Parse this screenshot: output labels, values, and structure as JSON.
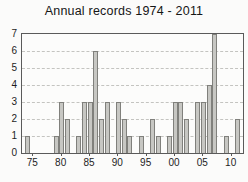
{
  "title": "Annual records 1974 - 2011",
  "chart_data": {
    "type": "bar",
    "title": "Annual records 1974 - 2011",
    "xlabel": "",
    "ylabel": "",
    "categories": [
      1974,
      1975,
      1976,
      1977,
      1978,
      1979,
      1980,
      1981,
      1982,
      1983,
      1984,
      1985,
      1986,
      1987,
      1988,
      1989,
      1990,
      1991,
      1992,
      1993,
      1994,
      1995,
      1996,
      1997,
      1998,
      1999,
      2000,
      2001,
      2002,
      2003,
      2004,
      2005,
      2006,
      2007,
      2008,
      2009,
      2010,
      2011
    ],
    "values": [
      1,
      0,
      0,
      0,
      0,
      1,
      3,
      2,
      0,
      1,
      3,
      3,
      6,
      2,
      3,
      0,
      3,
      2,
      1,
      0,
      1,
      0,
      2,
      1,
      0,
      1,
      3,
      3,
      2,
      0,
      3,
      3,
      4,
      7,
      0,
      1,
      0,
      2
    ],
    "ylim": [
      0,
      7
    ],
    "y_ticks": [
      0,
      1,
      2,
      3,
      4,
      5,
      6,
      7
    ],
    "x_tick_labels": [
      {
        "label": "75",
        "year": 1975
      },
      {
        "label": "80",
        "year": 1980
      },
      {
        "label": "85",
        "year": 1985
      },
      {
        "label": "90",
        "year": 1990
      },
      {
        "label": "95",
        "year": 1995
      },
      {
        "label": "00",
        "year": 2000
      },
      {
        "label": "05",
        "year": 2005
      },
      {
        "label": "10",
        "year": 2010
      }
    ],
    "xlim": [
      1973,
      2012
    ],
    "grid": "horizontal-dashed",
    "legend": "none",
    "bar_color": "#c7c7c3",
    "bar_border_color": "#80807c",
    "axis_color": "#5a5a5a",
    "background_color": "#fbfbfa"
  }
}
